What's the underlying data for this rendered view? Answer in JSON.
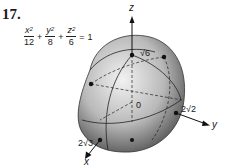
{
  "problem": {
    "number": "17.",
    "equation": {
      "terms": [
        {
          "numerator": "x",
          "exponent": "2",
          "denominator": "12"
        },
        {
          "numerator": "y",
          "exponent": "2",
          "denominator": "8"
        },
        {
          "numerator": "z",
          "exponent": "2",
          "denominator": "6"
        }
      ],
      "plus": "+",
      "equals": "=",
      "rhs": "1"
    }
  },
  "figure": {
    "axis_labels": {
      "x": "x",
      "y": "y",
      "z": "z"
    },
    "origin_label": "0",
    "intercepts": {
      "z": "√6",
      "y": "2√2",
      "x": "2√3"
    }
  }
}
